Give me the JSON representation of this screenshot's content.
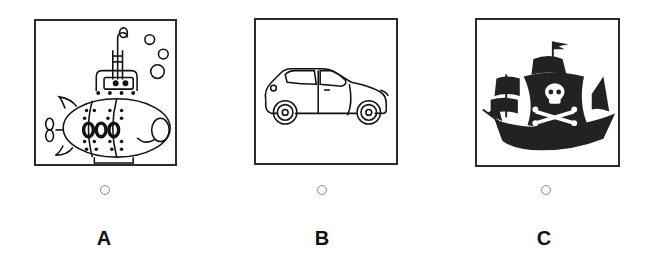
{
  "options": [
    {
      "letter": "A",
      "image": "submarine-cartoon",
      "selected": false
    },
    {
      "letter": "B",
      "image": "car-hatchback",
      "selected": false
    },
    {
      "letter": "C",
      "image": "pirate-ship",
      "selected": false
    }
  ]
}
